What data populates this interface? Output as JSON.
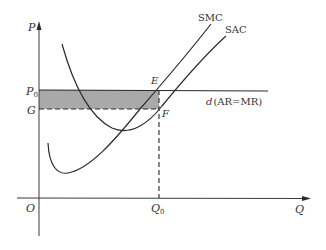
{
  "diagram": {
    "axes": {
      "y_label": "P",
      "x_label": "Q",
      "origin_label": "O"
    },
    "price_levels": {
      "p0_label": "P",
      "p0_sub": "0",
      "g_label": "G"
    },
    "quantity_levels": {
      "q0_label": "Q",
      "q0_sub": "0"
    },
    "points": {
      "e_label": "E",
      "f_label": "F"
    },
    "curves": {
      "smc_label": "SMC",
      "sac_label": "SAC",
      "demand_label_main": "d",
      "demand_label_rest": "(AR=MR)"
    },
    "colors": {
      "line": "#2a2a2a",
      "shaded_area": "#9a9a9a",
      "axis": "#3a3a3a"
    }
  }
}
